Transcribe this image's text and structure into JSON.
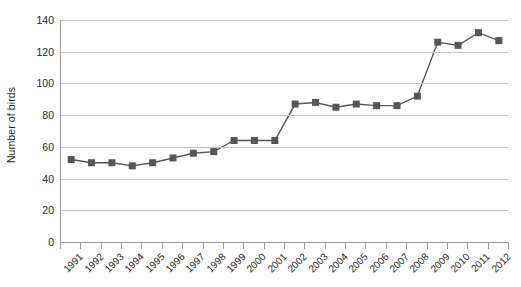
{
  "chart_data": {
    "type": "line",
    "title": "",
    "xlabel": "",
    "ylabel": "Number of birds",
    "ylim": [
      0,
      140
    ],
    "ytick_step": 20,
    "yticks": [
      0,
      20,
      40,
      60,
      80,
      100,
      120,
      140
    ],
    "ytick_labels": [
      "0",
      "20",
      "40",
      "60",
      "80",
      "100",
      "120",
      "140"
    ],
    "grid": true,
    "legend": "none",
    "marker": "square",
    "categories": [
      "1991",
      "1992",
      "1993",
      "1994",
      "1995",
      "1996",
      "1997",
      "1998",
      "1999",
      "2000",
      "2001",
      "2002",
      "2003",
      "2004",
      "2005",
      "2006",
      "2007",
      "2008",
      "2009",
      "2010",
      "2011",
      "2012"
    ],
    "values": [
      52,
      50,
      50,
      48,
      50,
      53,
      56,
      57,
      64,
      64,
      64,
      87,
      88,
      85,
      87,
      86,
      86,
      92,
      126,
      124,
      132,
      127
    ],
    "series_color": "#565656",
    "gridline_color": "#bfbfbf",
    "axis_color": "#9a9a9a"
  }
}
